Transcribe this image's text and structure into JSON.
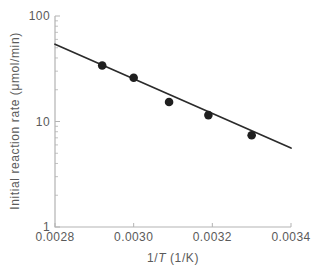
{
  "figure": {
    "ylabel": "Initial reaction rate (μmol/min)",
    "xlabel_parts": {
      "prefix": "1/",
      "variable": "T",
      "suffix": " (1/K)"
    }
  },
  "chart_data": {
    "type": "scatter",
    "title": "",
    "xlabel": "1/T (1/K)",
    "ylabel": "Initial reaction rate (μmol/min)",
    "x_scale": "linear",
    "y_scale": "log",
    "xlim": [
      0.0028,
      0.0034
    ],
    "ylim": [
      1,
      100
    ],
    "grid": false,
    "legend": "none",
    "x_ticks": [
      {
        "value": 0.0028,
        "label": "0.0028"
      },
      {
        "value": 0.003,
        "label": "0.0030"
      },
      {
        "value": 0.0032,
        "label": "0.0032"
      },
      {
        "value": 0.0034,
        "label": "0.0034"
      }
    ],
    "y_ticks": [
      {
        "value": 1,
        "label": "1"
      },
      {
        "value": 10,
        "label": "10"
      },
      {
        "value": 100,
        "label": "100"
      }
    ],
    "y_minor_ticks": [
      2,
      3,
      4,
      5,
      6,
      7,
      8,
      9,
      20,
      30,
      40,
      50,
      60,
      70,
      80,
      90
    ],
    "series": [
      {
        "name": "measured initial rates",
        "type": "scatter",
        "points": [
          {
            "x": 0.00292,
            "y": 34
          },
          {
            "x": 0.003,
            "y": 26
          },
          {
            "x": 0.00309,
            "y": 15.3
          },
          {
            "x": 0.00319,
            "y": 11.5
          },
          {
            "x": 0.0033,
            "y": 7.4
          }
        ]
      }
    ],
    "trendline": {
      "x1": 0.0028,
      "y1": 54,
      "x2": 0.0034,
      "y2": 5.6
    },
    "colors": {
      "point": "#1f1f1f",
      "line": "#2b2b2b",
      "axis": "#b3b3b3",
      "text": "#5a5a5a"
    }
  }
}
